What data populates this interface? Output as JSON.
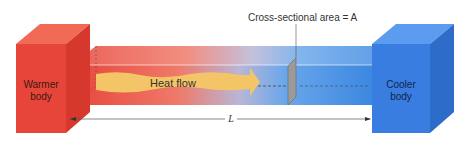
{
  "diagram": {
    "warm_body": {
      "label_line1": "Warmer",
      "label_line2": "body",
      "color": "#e8453a"
    },
    "cool_body": {
      "label_line1": "Cooler",
      "label_line2": "body",
      "color": "#3a7de0"
    },
    "heat_flow_label": "Heat flow",
    "area_label": "Cross-sectional area = A",
    "length_label": "L"
  }
}
